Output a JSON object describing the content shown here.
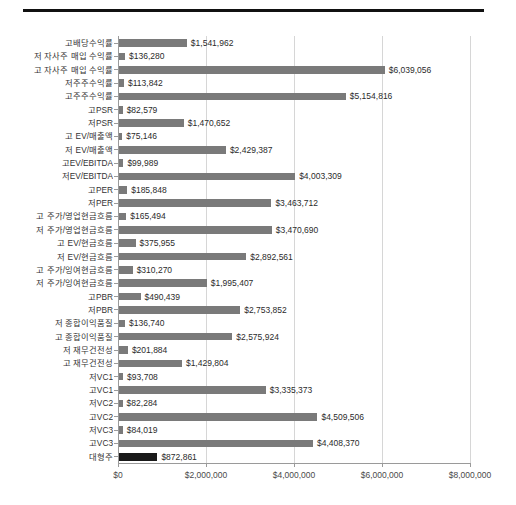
{
  "chart_data": {
    "type": "bar",
    "orientation": "horizontal",
    "title": "",
    "subtitle": "",
    "xlabel": "",
    "ylabel": "",
    "xlim": [
      0,
      8000000
    ],
    "grid": true,
    "legend": false,
    "axis_tick_labels": [
      "$0",
      "$2,000,000",
      "$4,000,000",
      "$6,000,000",
      "$8,000,000"
    ],
    "axis_tick_values": [
      0,
      2000000,
      4000000,
      6000000,
      8000000
    ],
    "categories": [
      "고배당수익률",
      "저 자사주 매입 수익률",
      "고 자사주 매입 수익률",
      "저주주수익률",
      "고주주수익률",
      "고PSR",
      "저PSR",
      "고 EV/매출액",
      "저 EV/매출액",
      "고EV/EBITDA",
      "저EV/EBITDA",
      "고PER",
      "저PER",
      "고 주가/영업현금흐름",
      "저 주가/영업현금흐름",
      "고 EV/현금흐름",
      "저 EV/현금흐름",
      "고 주가/잉여현금흐름",
      "저 주가/잉여현금흐름",
      "고PBR",
      "저PBR",
      "저 종합이익품질",
      "고 종합이익품질",
      "저 재무건전성",
      "고 재무건전성",
      "저VC1",
      "고VC1",
      "저VC2",
      "고VC2",
      "저VC3",
      "고VC3",
      "대형주"
    ],
    "values": [
      1541962,
      136280,
      6039056,
      113842,
      5154816,
      82579,
      1470652,
      75146,
      2429387,
      99989,
      4003309,
      185848,
      3463712,
      165494,
      3470690,
      375955,
      2892561,
      310270,
      1995407,
      490439,
      2753852,
      136740,
      2575924,
      201884,
      1429804,
      93708,
      3335373,
      82284,
      4509506,
      84019,
      4408370,
      872861
    ],
    "value_labels": [
      "$1,541,962",
      "$136,280",
      "$6,039,056",
      "$113,842",
      "$5,154,816",
      "$82,579",
      "$1,470,652",
      "$75,146",
      "$2,429,387",
      "$99,989",
      "$4,003,309",
      "$185,848",
      "$3,463,712",
      "$165,494",
      "$3,470,690",
      "$375,955",
      "$2,892,561",
      "$310,270",
      "$1,995,407",
      "$490,439",
      "$2,753,852",
      "$136,740",
      "$2,575,924",
      "$201,884",
      "$1,429,804",
      "$93,708",
      "$3,335,373",
      "$82,284",
      "$4,509,506",
      "$84,019",
      "$4,408,370",
      "$872,861"
    ],
    "highlighted_category": "대형주",
    "colors": {
      "bar": "#7a7a7a",
      "bar_highlight": "#1a1a1a",
      "gridline": "#d6d6d6",
      "axis": "#9a9a9a",
      "text": "#333333",
      "top_rule": "#111111"
    }
  }
}
